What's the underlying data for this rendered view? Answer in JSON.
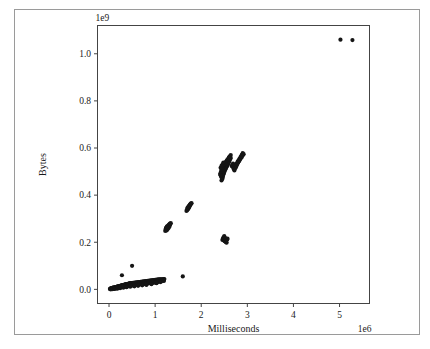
{
  "figure": {
    "background_color": "#ffffff",
    "border_color": "#9a9a9a",
    "axes_color": "#444444",
    "marker_color": "#151515"
  },
  "chart_data": {
    "type": "scatter",
    "title": "",
    "xlabel": "Milliseconds",
    "ylabel": "Bytes",
    "x_offset_text": "1e6",
    "y_offset_text": "1e9",
    "x_scale": 1000000,
    "y_scale": 1000000000,
    "xlim": [
      -0.25,
      5.65
    ],
    "ylim": [
      -0.06,
      1.12
    ],
    "xticks": [
      0,
      1,
      2,
      3,
      4,
      5
    ],
    "xticklabels": [
      "0",
      "1",
      "2",
      "3",
      "4",
      "5"
    ],
    "yticks": [
      0.0,
      0.2,
      0.4,
      0.6,
      0.8,
      1.0
    ],
    "yticklabels": [
      "0.0",
      "0.2",
      "0.4",
      "0.6",
      "0.8",
      "1.0"
    ],
    "grid": false,
    "legend": null,
    "marker": "o",
    "marker_size": 3.1,
    "points": [
      [
        0.02,
        0.002
      ],
      [
        0.03,
        0.003
      ],
      [
        0.04,
        0.004
      ],
      [
        0.05,
        0.004
      ],
      [
        0.06,
        0.005
      ],
      [
        0.07,
        0.006
      ],
      [
        0.08,
        0.006
      ],
      [
        0.09,
        0.007
      ],
      [
        0.1,
        0.007
      ],
      [
        0.11,
        0.008
      ],
      [
        0.12,
        0.008
      ],
      [
        0.13,
        0.009
      ],
      [
        0.14,
        0.01
      ],
      [
        0.15,
        0.01
      ],
      [
        0.16,
        0.011
      ],
      [
        0.17,
        0.011
      ],
      [
        0.18,
        0.012
      ],
      [
        0.19,
        0.012
      ],
      [
        0.2,
        0.013
      ],
      [
        0.21,
        0.013
      ],
      [
        0.22,
        0.014
      ],
      [
        0.23,
        0.014
      ],
      [
        0.24,
        0.015
      ],
      [
        0.25,
        0.015
      ],
      [
        0.26,
        0.016
      ],
      [
        0.27,
        0.016
      ],
      [
        0.28,
        0.017
      ],
      [
        0.29,
        0.017
      ],
      [
        0.3,
        0.018
      ],
      [
        0.31,
        0.018
      ],
      [
        0.32,
        0.019
      ],
      [
        0.33,
        0.019
      ],
      [
        0.34,
        0.02
      ],
      [
        0.35,
        0.02
      ],
      [
        0.36,
        0.021
      ],
      [
        0.37,
        0.021
      ],
      [
        0.38,
        0.022
      ],
      [
        0.39,
        0.022
      ],
      [
        0.4,
        0.022
      ],
      [
        0.41,
        0.023
      ],
      [
        0.42,
        0.023
      ],
      [
        0.43,
        0.024
      ],
      [
        0.44,
        0.024
      ],
      [
        0.45,
        0.025
      ],
      [
        0.46,
        0.025
      ],
      [
        0.47,
        0.026
      ],
      [
        0.48,
        0.026
      ],
      [
        0.49,
        0.027
      ],
      [
        0.5,
        0.027
      ],
      [
        0.52,
        0.028
      ],
      [
        0.54,
        0.028
      ],
      [
        0.56,
        0.029
      ],
      [
        0.58,
        0.029
      ],
      [
        0.6,
        0.03
      ],
      [
        0.62,
        0.03
      ],
      [
        0.64,
        0.031
      ],
      [
        0.66,
        0.031
      ],
      [
        0.68,
        0.032
      ],
      [
        0.7,
        0.032
      ],
      [
        0.72,
        0.033
      ],
      [
        0.74,
        0.033
      ],
      [
        0.76,
        0.034
      ],
      [
        0.78,
        0.034
      ],
      [
        0.8,
        0.035
      ],
      [
        0.82,
        0.035
      ],
      [
        0.84,
        0.036
      ],
      [
        0.86,
        0.036
      ],
      [
        0.88,
        0.037
      ],
      [
        0.9,
        0.037
      ],
      [
        0.92,
        0.038
      ],
      [
        0.94,
        0.038
      ],
      [
        0.96,
        0.039
      ],
      [
        0.98,
        0.039
      ],
      [
        1.0,
        0.04
      ],
      [
        1.02,
        0.04
      ],
      [
        1.04,
        0.041
      ],
      [
        1.06,
        0.041
      ],
      [
        1.08,
        0.042
      ],
      [
        1.1,
        0.042
      ],
      [
        1.12,
        0.043
      ],
      [
        1.14,
        0.043
      ],
      [
        1.16,
        0.043
      ],
      [
        1.18,
        0.044
      ],
      [
        1.2,
        0.044
      ],
      [
        0.05,
        0.001
      ],
      [
        0.1,
        0.002
      ],
      [
        0.15,
        0.004
      ],
      [
        0.2,
        0.006
      ],
      [
        0.25,
        0.008
      ],
      [
        0.3,
        0.01
      ],
      [
        0.35,
        0.012
      ],
      [
        0.4,
        0.013
      ],
      [
        0.45,
        0.015
      ],
      [
        0.5,
        0.016
      ],
      [
        0.55,
        0.018
      ],
      [
        0.6,
        0.019
      ],
      [
        0.65,
        0.02
      ],
      [
        0.7,
        0.021
      ],
      [
        0.75,
        0.022
      ],
      [
        0.8,
        0.023
      ],
      [
        0.85,
        0.025
      ],
      [
        0.9,
        0.026
      ],
      [
        0.95,
        0.027
      ],
      [
        1.0,
        0.028
      ],
      [
        1.05,
        0.03
      ],
      [
        1.1,
        0.033
      ],
      [
        1.15,
        0.036
      ],
      [
        1.18,
        0.038
      ],
      [
        0.03,
        0.0
      ],
      [
        0.07,
        0.001
      ],
      [
        0.12,
        0.002
      ],
      [
        0.18,
        0.003
      ],
      [
        0.24,
        0.005
      ],
      [
        0.31,
        0.007
      ],
      [
        0.38,
        0.009
      ],
      [
        0.46,
        0.011
      ],
      [
        0.55,
        0.013
      ],
      [
        0.63,
        0.015
      ],
      [
        0.72,
        0.017
      ],
      [
        0.81,
        0.019
      ],
      [
        0.92,
        0.022
      ],
      [
        1.03,
        0.026
      ],
      [
        1.12,
        0.031
      ],
      [
        1.19,
        0.036
      ],
      [
        0.28,
        0.06
      ],
      [
        0.5,
        0.1
      ],
      [
        1.6,
        0.055
      ],
      [
        1.22,
        0.248
      ],
      [
        1.23,
        0.252
      ],
      [
        1.24,
        0.256
      ],
      [
        1.25,
        0.259
      ],
      [
        1.26,
        0.262
      ],
      [
        1.27,
        0.264
      ],
      [
        1.28,
        0.266
      ],
      [
        1.29,
        0.268
      ],
      [
        1.3,
        0.27
      ],
      [
        1.31,
        0.272
      ],
      [
        1.32,
        0.274
      ],
      [
        1.33,
        0.277
      ],
      [
        1.25,
        0.25
      ],
      [
        1.27,
        0.255
      ],
      [
        1.29,
        0.26
      ],
      [
        1.31,
        0.266
      ],
      [
        1.24,
        0.262
      ],
      [
        1.26,
        0.268
      ],
      [
        1.28,
        0.271
      ],
      [
        1.3,
        0.275
      ],
      [
        1.23,
        0.257
      ],
      [
        1.25,
        0.264
      ],
      [
        1.32,
        0.279
      ],
      [
        1.34,
        0.281
      ],
      [
        1.68,
        0.333
      ],
      [
        1.7,
        0.337
      ],
      [
        1.71,
        0.34
      ],
      [
        1.72,
        0.343
      ],
      [
        1.73,
        0.346
      ],
      [
        1.74,
        0.35
      ],
      [
        1.75,
        0.354
      ],
      [
        1.76,
        0.358
      ],
      [
        1.77,
        0.361
      ],
      [
        1.78,
        0.363
      ],
      [
        1.7,
        0.345
      ],
      [
        1.72,
        0.35
      ],
      [
        1.74,
        0.356
      ],
      [
        1.76,
        0.36
      ],
      [
        1.69,
        0.338
      ],
      [
        1.71,
        0.347
      ],
      [
        1.73,
        0.352
      ],
      [
        1.75,
        0.357
      ],
      [
        1.77,
        0.364
      ],
      [
        1.79,
        0.366
      ],
      [
        2.47,
        0.214
      ],
      [
        2.49,
        0.216
      ],
      [
        2.5,
        0.212
      ],
      [
        2.51,
        0.209
      ],
      [
        2.52,
        0.206
      ],
      [
        2.53,
        0.203
      ],
      [
        2.54,
        0.2
      ],
      [
        2.55,
        0.198
      ],
      [
        2.48,
        0.22
      ],
      [
        2.5,
        0.222
      ],
      [
        2.52,
        0.218
      ],
      [
        2.54,
        0.212
      ],
      [
        2.46,
        0.21
      ],
      [
        2.49,
        0.207
      ],
      [
        2.51,
        0.204
      ],
      [
        2.56,
        0.213
      ],
      [
        2.5,
        0.226
      ],
      [
        2.53,
        0.216
      ],
      [
        2.55,
        0.208
      ],
      [
        2.57,
        0.215
      ],
      [
        2.44,
        0.462
      ],
      [
        2.46,
        0.47
      ],
      [
        2.47,
        0.478
      ],
      [
        2.48,
        0.486
      ],
      [
        2.49,
        0.492
      ],
      [
        2.5,
        0.498
      ],
      [
        2.51,
        0.503
      ],
      [
        2.52,
        0.508
      ],
      [
        2.53,
        0.512
      ],
      [
        2.54,
        0.516
      ],
      [
        2.55,
        0.52
      ],
      [
        2.56,
        0.524
      ],
      [
        2.57,
        0.528
      ],
      [
        2.58,
        0.532
      ],
      [
        2.59,
        0.536
      ],
      [
        2.6,
        0.54
      ],
      [
        2.61,
        0.545
      ],
      [
        2.62,
        0.55
      ],
      [
        2.63,
        0.554
      ],
      [
        2.64,
        0.558
      ],
      [
        2.45,
        0.48
      ],
      [
        2.47,
        0.495
      ],
      [
        2.49,
        0.505
      ],
      [
        2.51,
        0.515
      ],
      [
        2.53,
        0.522
      ],
      [
        2.55,
        0.53
      ],
      [
        2.57,
        0.538
      ],
      [
        2.59,
        0.546
      ],
      [
        2.46,
        0.49
      ],
      [
        2.48,
        0.5
      ],
      [
        2.5,
        0.51
      ],
      [
        2.52,
        0.518
      ],
      [
        2.54,
        0.526
      ],
      [
        2.56,
        0.534
      ],
      [
        2.58,
        0.542
      ],
      [
        2.6,
        0.552
      ],
      [
        2.43,
        0.5
      ],
      [
        2.45,
        0.512
      ],
      [
        2.47,
        0.52
      ],
      [
        2.49,
        0.528
      ],
      [
        2.51,
        0.534
      ],
      [
        2.53,
        0.54
      ],
      [
        2.55,
        0.546
      ],
      [
        2.57,
        0.552
      ],
      [
        2.44,
        0.508
      ],
      [
        2.46,
        0.518
      ],
      [
        2.48,
        0.526
      ],
      [
        2.5,
        0.532
      ],
      [
        2.42,
        0.516
      ],
      [
        2.44,
        0.524
      ],
      [
        2.46,
        0.53
      ],
      [
        2.48,
        0.538
      ],
      [
        2.41,
        0.49
      ],
      [
        2.43,
        0.478
      ],
      [
        2.45,
        0.468
      ],
      [
        2.42,
        0.484
      ],
      [
        2.6,
        0.56
      ],
      [
        2.62,
        0.565
      ],
      [
        2.64,
        0.57
      ],
      [
        2.61,
        0.558
      ],
      [
        2.7,
        0.515
      ],
      [
        2.72,
        0.52
      ],
      [
        2.74,
        0.525
      ],
      [
        2.76,
        0.53
      ],
      [
        2.78,
        0.535
      ],
      [
        2.8,
        0.54
      ],
      [
        2.82,
        0.545
      ],
      [
        2.84,
        0.55
      ],
      [
        2.86,
        0.556
      ],
      [
        2.88,
        0.562
      ],
      [
        2.9,
        0.568
      ],
      [
        2.92,
        0.574
      ],
      [
        2.71,
        0.51
      ],
      [
        2.73,
        0.518
      ],
      [
        2.75,
        0.526
      ],
      [
        2.77,
        0.534
      ],
      [
        2.79,
        0.542
      ],
      [
        2.81,
        0.548
      ],
      [
        2.83,
        0.554
      ],
      [
        2.85,
        0.56
      ],
      [
        2.87,
        0.566
      ],
      [
        2.89,
        0.572
      ],
      [
        2.72,
        0.505
      ],
      [
        2.74,
        0.514
      ],
      [
        2.76,
        0.522
      ],
      [
        2.78,
        0.53
      ],
      [
        2.8,
        0.538
      ],
      [
        2.82,
        0.546
      ],
      [
        2.84,
        0.554
      ],
      [
        2.86,
        0.562
      ],
      [
        2.88,
        0.57
      ],
      [
        2.9,
        0.578
      ],
      [
        2.68,
        0.52
      ],
      [
        2.7,
        0.53
      ],
      [
        2.66,
        0.524
      ],
      [
        2.69,
        0.534
      ],
      [
        5.02,
        1.06
      ],
      [
        5.28,
        1.058
      ]
    ]
  }
}
